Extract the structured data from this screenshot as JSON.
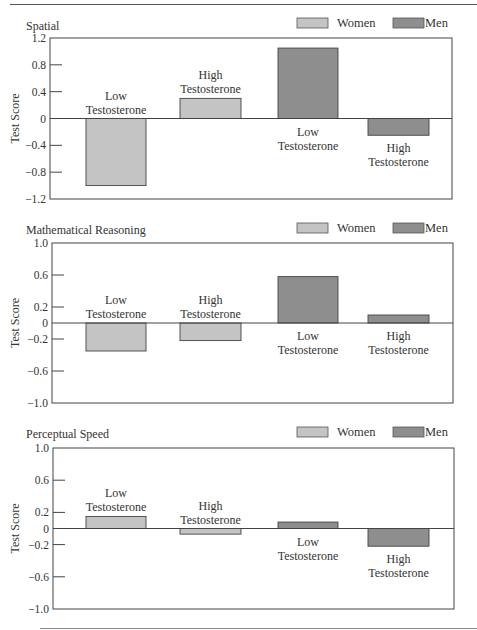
{
  "colors": {
    "women": "#c4c4c4",
    "men": "#8e8e8e",
    "axis": "#444444"
  },
  "legend": {
    "women": "Women",
    "men": "Men"
  },
  "chart_data": [
    {
      "type": "bar",
      "title": "Spatial",
      "ylabel": "Test Score",
      "ylim": [
        -1.2,
        1.2
      ],
      "yticks": [
        1.2,
        0.8,
        0.4,
        0,
        -0.4,
        -0.8,
        -1.2
      ],
      "ytick_labels": [
        "1.2",
        "0.8",
        "0.4",
        "0",
        "−0.4",
        "−0.8",
        "−1.2"
      ],
      "grid": false,
      "legend_position": "top-right",
      "categories": [
        "Women, Low Testosterone",
        "Women, High Testosterone",
        "Men, Low Testosterone",
        "Men, High Testosterone"
      ],
      "series": [
        {
          "name": "Women",
          "values": [
            -1.0,
            0.3
          ]
        },
        {
          "name": "Men",
          "values": [
            1.05,
            -0.25
          ]
        }
      ],
      "bars": [
        {
          "group": "Women",
          "label1": "Low",
          "label2": "Testosterone",
          "value": -1.0
        },
        {
          "group": "Women",
          "label1": "High",
          "label2": "Testosterone",
          "value": 0.3
        },
        {
          "group": "Men",
          "label1": "Low",
          "label2": "Testosterone",
          "value": 1.05
        },
        {
          "group": "Men",
          "label1": "High",
          "label2": "Testosterone",
          "value": -0.25
        }
      ]
    },
    {
      "type": "bar",
      "title": "Mathematical Reasoning",
      "ylabel": "Test Score",
      "ylim": [
        -1.0,
        1.0
      ],
      "yticks": [
        1.0,
        0.6,
        0.2,
        0,
        -0.2,
        -0.6,
        -1.0
      ],
      "ytick_labels": [
        "1.0",
        "0.6",
        "0.2",
        "0",
        "−0.2",
        "−0.6",
        "−1.0"
      ],
      "grid": false,
      "legend_position": "top-right",
      "categories": [
        "Women, Low Testosterone",
        "Women, High Testosterone",
        "Men, Low Testosterone",
        "Men, High Testosterone"
      ],
      "series": [
        {
          "name": "Women",
          "values": [
            -0.35,
            -0.22
          ]
        },
        {
          "name": "Men",
          "values": [
            0.58,
            0.1
          ]
        }
      ],
      "bars": [
        {
          "group": "Women",
          "label1": "Low",
          "label2": "Testosterone",
          "value": -0.35
        },
        {
          "group": "Women",
          "label1": "High",
          "label2": "Testosterone",
          "value": -0.22
        },
        {
          "group": "Men",
          "label1": "Low",
          "label2": "Testosterone",
          "value": 0.58
        },
        {
          "group": "Men",
          "label1": "High",
          "label2": "Testosterone",
          "value": 0.1
        }
      ]
    },
    {
      "type": "bar",
      "title": "Perceptual Speed",
      "ylabel": "Test Score",
      "ylim": [
        -1.0,
        1.0
      ],
      "yticks": [
        1.0,
        0.6,
        0.2,
        0,
        -0.2,
        -0.6,
        -1.0
      ],
      "ytick_labels": [
        "1.0",
        "0.6",
        "0.2",
        "0",
        "−0.2",
        "−0.6",
        "−1.0"
      ],
      "grid": false,
      "legend_position": "top-right",
      "categories": [
        "Women, Low Testosterone",
        "Women, High Testosterone",
        "Men, Low Testosterone",
        "Men, High Testosterone"
      ],
      "series": [
        {
          "name": "Women",
          "values": [
            0.15,
            -0.07
          ]
        },
        {
          "name": "Men",
          "values": [
            0.08,
            -0.22
          ]
        }
      ],
      "bars": [
        {
          "group": "Women",
          "label1": "Low",
          "label2": "Testosterone",
          "value": 0.15
        },
        {
          "group": "Women",
          "label1": "High",
          "label2": "Testosterone",
          "value": -0.07
        },
        {
          "group": "Men",
          "label1": "Low",
          "label2": "Testosterone",
          "value": 0.08
        },
        {
          "group": "Men",
          "label1": "High",
          "label2": "Testosterone",
          "value": -0.22
        }
      ]
    }
  ]
}
